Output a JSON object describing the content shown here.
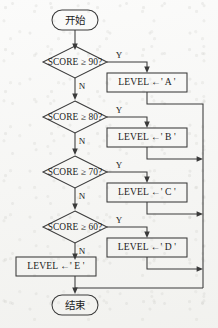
{
  "diagram": {
    "type": "flowchart",
    "language": "zh-CN",
    "colors": {
      "stroke": "#3a3a3a",
      "text": "#1c1c1c",
      "paper": "#f6f6f4",
      "node_fill": "#f4f4f1"
    },
    "terminators": {
      "start": "开始",
      "end": "结束"
    },
    "branch_labels": {
      "yes": "Y",
      "no": "N"
    },
    "decisions": [
      {
        "id": "d90",
        "text": "SCORE ≥ 90?",
        "yes": "Y",
        "no": "N"
      },
      {
        "id": "d80",
        "text": "SCORE ≥ 80?",
        "yes": "Y",
        "no": "N"
      },
      {
        "id": "d70",
        "text": "SCORE ≥ 70?",
        "yes": "Y",
        "no": "N"
      },
      {
        "id": "d60",
        "text": "SCORE ≥ 60?",
        "yes": "Y",
        "no": "N"
      }
    ],
    "processes": [
      {
        "id": "pA",
        "text": "LEVEL ←' A '"
      },
      {
        "id": "pB",
        "text": "LEVEL ←' B '"
      },
      {
        "id": "pC",
        "text": "LEVEL ←' C '"
      },
      {
        "id": "pD",
        "text": "LEVEL ←' D '"
      },
      {
        "id": "pE",
        "text": "LEVEL ←' E '"
      }
    ]
  }
}
